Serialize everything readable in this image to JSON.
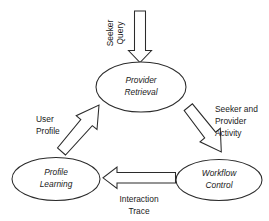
{
  "diagram": {
    "type": "cycle-flow-diagram",
    "background_color": "#ffffff",
    "stroke_color": "#2b2b2b",
    "text_color": "#1a1a1a",
    "nodes": [
      {
        "id": "provider-retrieval",
        "shape": "ellipse",
        "line1": "Provider",
        "line2": "Retrieval",
        "style": "italic"
      },
      {
        "id": "profile-learning",
        "shape": "ellipse",
        "line1": "Profile",
        "line2": "Learning",
        "style": "italic"
      },
      {
        "id": "workflow-control",
        "shape": "ellipse",
        "line1": "Workflow",
        "line2": "Control",
        "style": "italic"
      }
    ],
    "edges": [
      {
        "id": "seeker-query",
        "from": "external-input",
        "to": "provider-retrieval",
        "direction": "down",
        "orientation": "vertical-rotated-text",
        "line1": "Seeker",
        "line2": "Query"
      },
      {
        "id": "seeker-and-provider-activity",
        "from": "provider-retrieval",
        "to": "workflow-control",
        "direction": "down-right",
        "line1": "Seeker and",
        "line2": "Provider",
        "line3": "Activity"
      },
      {
        "id": "interaction-trace",
        "from": "workflow-control",
        "to": "profile-learning",
        "direction": "left",
        "line1": "Interaction",
        "line2": "Trace"
      },
      {
        "id": "user-profile",
        "from": "profile-learning",
        "to": "provider-retrieval",
        "direction": "up-right",
        "line1": "User",
        "line2": "Profile"
      }
    ]
  }
}
